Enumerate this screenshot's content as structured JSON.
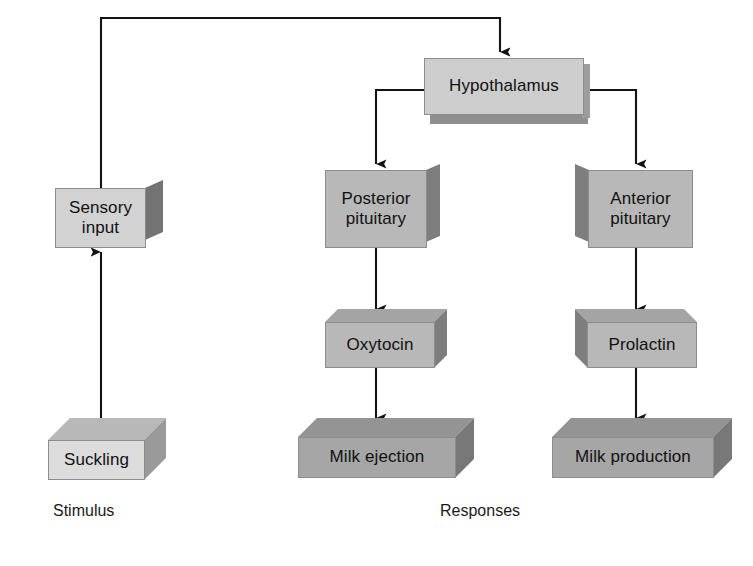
{
  "diagram": {
    "background_color": "#ffffff",
    "line_color": "#141414"
  },
  "captions": [
    {
      "id": "stimulus",
      "text": "Stimulus"
    },
    {
      "id": "responses",
      "text": "Responses"
    }
  ],
  "nodes": [
    {
      "id": "sensory-input",
      "label": "Sensory\ninput",
      "column": "stimulus",
      "front_color": "#d2d2d2",
      "side_color": "#737373",
      "top_color": "#b4b4b4"
    },
    {
      "id": "suckling",
      "label": "Suckling",
      "column": "stimulus",
      "front_color": "#dcdcdc",
      "side_color": "#9a9a9a",
      "top_color": "#b8b8b8"
    },
    {
      "id": "hypothalamus",
      "label": "Hypothalamus",
      "column": "center",
      "front_color": "#cdcdcd",
      "side_color": "#8a8a8a",
      "top_color": "#8f8f8f"
    },
    {
      "id": "posterior-pituitary",
      "label": "Posterior\npituitary",
      "column": "middle",
      "front_color": "#b8b8b8",
      "side_color": "#7e7e7e",
      "top_color": "#a2a2a2"
    },
    {
      "id": "anterior-pituitary",
      "label": "Anterior\npituitary",
      "column": "right",
      "front_color": "#b8b8b8",
      "side_color": "#7e7e7e",
      "top_color": "#a2a2a2"
    },
    {
      "id": "oxytocin",
      "label": "Oxytocin",
      "column": "middle",
      "front_color": "#b8b8b8",
      "side_color": "#7e7e7e",
      "top_color": "#a4a4a4"
    },
    {
      "id": "prolactin",
      "label": "Prolactin",
      "column": "right",
      "front_color": "#b8b8b8",
      "side_color": "#7e7e7e",
      "top_color": "#a4a4a4"
    },
    {
      "id": "milk-ejection",
      "label": "Milk ejection",
      "column": "middle",
      "front_color": "#a6a6a6",
      "side_color": "#787878",
      "top_color": "#949494"
    },
    {
      "id": "milk-production",
      "label": "Milk production",
      "column": "right",
      "front_color": "#a6a6a6",
      "side_color": "#787878",
      "top_color": "#949494"
    }
  ],
  "edges": [
    {
      "id": "suckling-to-sensory-input",
      "from": "suckling",
      "to": "sensory-input",
      "direction": "up"
    },
    {
      "id": "sensory-input-to-hypothalamus",
      "from": "sensory-input",
      "to": "hypothalamus",
      "direction": "routed-over-top"
    },
    {
      "id": "hypothalamus-to-posterior-pituitary",
      "from": "hypothalamus",
      "to": "posterior-pituitary",
      "direction": "left-then-down"
    },
    {
      "id": "hypothalamus-to-anterior-pituitary",
      "from": "hypothalamus",
      "to": "anterior-pituitary",
      "direction": "right-then-down"
    },
    {
      "id": "posterior-pituitary-to-oxytocin",
      "from": "posterior-pituitary",
      "to": "oxytocin",
      "direction": "down"
    },
    {
      "id": "anterior-pituitary-to-prolactin",
      "from": "anterior-pituitary",
      "to": "prolactin",
      "direction": "down"
    },
    {
      "id": "oxytocin-to-milk-ejection",
      "from": "oxytocin",
      "to": "milk-ejection",
      "direction": "down"
    },
    {
      "id": "prolactin-to-milk-production",
      "from": "prolactin",
      "to": "milk-production",
      "direction": "down"
    }
  ]
}
